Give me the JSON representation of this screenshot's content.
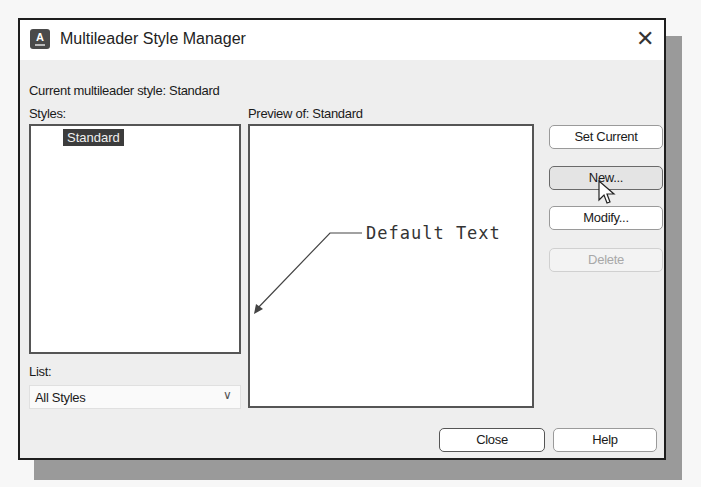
{
  "window": {
    "title": "Multileader Style Manager",
    "close_glyph": "✕",
    "app_icon_letter": "A"
  },
  "current_style": {
    "label": "Current multileader style: Standard"
  },
  "styles": {
    "label": "Styles:",
    "items": [
      {
        "name": "Standard",
        "selected": true
      }
    ]
  },
  "preview": {
    "label": "Preview of: Standard",
    "leader_text": "Default Text"
  },
  "list_filter": {
    "label": "List:",
    "selected": "All Styles",
    "chevron_glyph": "∨"
  },
  "side_buttons": {
    "set_current": "Set Current",
    "new": "New...",
    "modify": "Modify...",
    "delete": "Delete"
  },
  "footer_buttons": {
    "close": "Close",
    "help": "Help"
  },
  "colors": {
    "selection_bg": "#3c3c3c",
    "dialog_bg": "#eeeeee",
    "disabled_text": "#a8a8a8"
  }
}
